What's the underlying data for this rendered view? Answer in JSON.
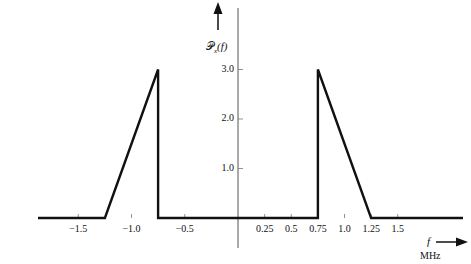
{
  "chart_data": {
    "type": "line",
    "title": "",
    "ylabel": "P_x(f)",
    "ylabel_display": "𝒫x(f)",
    "xlabel": "f",
    "xunit": "MHz",
    "xlim": [
      -2.0,
      2.0
    ],
    "ylim": [
      0,
      4.0
    ],
    "grid": false,
    "legend": null,
    "x_ticks": [
      {
        "value": -1.5,
        "label": "−1.5"
      },
      {
        "value": -1.0,
        "label": "−1.0"
      },
      {
        "value": -0.5,
        "label": "−0.5"
      },
      {
        "value": 0.25,
        "label": "0.25"
      },
      {
        "value": 0.5,
        "label": "0.5"
      },
      {
        "value": 0.75,
        "label": "0.75"
      },
      {
        "value": 1.0,
        "label": "1.0"
      },
      {
        "value": 1.25,
        "label": "1.25"
      },
      {
        "value": 1.5,
        "label": "1.5"
      }
    ],
    "y_ticks": [
      {
        "value": 1.0,
        "label": "1.0"
      },
      {
        "value": 2.0,
        "label": "2.0"
      },
      {
        "value": 3.0,
        "label": "3.0"
      }
    ],
    "series": [
      {
        "name": "power spectral density",
        "x": [
          -2.0,
          -1.25,
          -0.75,
          -0.75,
          0.75,
          0.75,
          1.25,
          2.0
        ],
        "y": [
          0,
          0,
          3.0,
          0,
          0,
          3.0,
          0,
          0
        ]
      }
    ]
  },
  "labels": {
    "y_axis_symbol": "𝒫",
    "y_axis_sub": "x",
    "y_axis_arg": "(f)",
    "x_axis_symbol": "f",
    "x_axis_unit": "MHz"
  }
}
